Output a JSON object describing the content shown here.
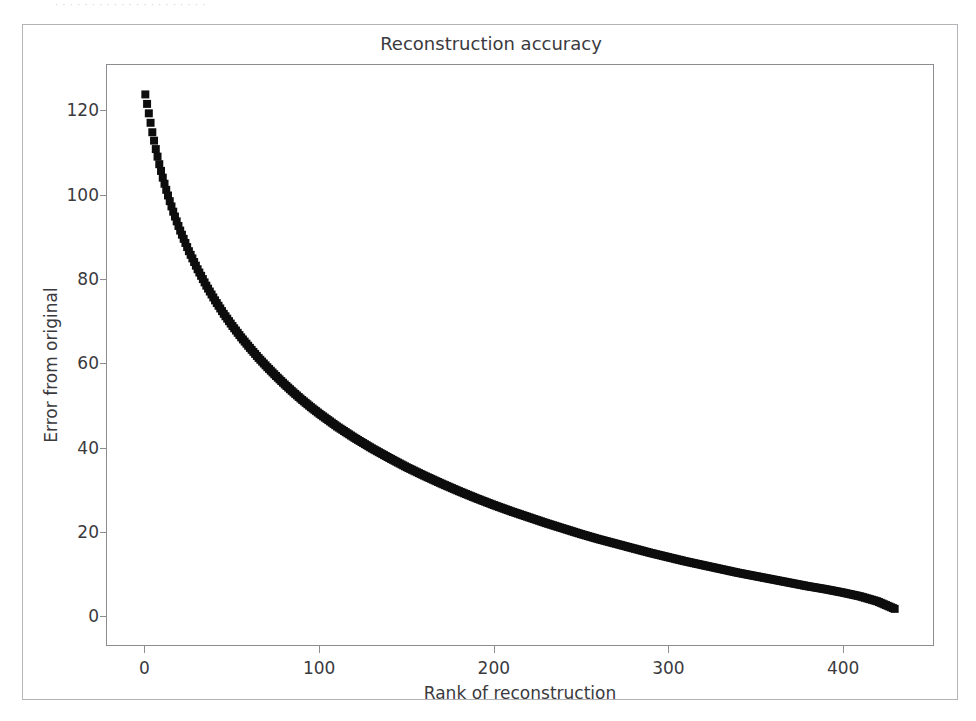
{
  "page": {
    "scan_sliver_text": "· · · ·  · · · · · · · ·            · · · ·  · ·  · · ·",
    "background_color": "#ffffff",
    "frame_color": "#b4b4b8"
  },
  "figure": {
    "title": "Reconstruction accuracy",
    "axes_color": "#8d8d91",
    "text_color": "#3a3a3e",
    "marker_color": "#0d0d0d"
  },
  "chart_data": {
    "type": "scatter",
    "title": "Reconstruction accuracy",
    "xlabel": "Rank of reconstruction",
    "ylabel": "Error from original",
    "xlim": [
      -22,
      452
    ],
    "ylim": [
      -7,
      131
    ],
    "xticks": [
      0,
      100,
      200,
      300,
      400
    ],
    "xtick_labels": [
      "0",
      "100",
      "200",
      "300",
      "400"
    ],
    "yticks": [
      0,
      20,
      40,
      60,
      80,
      100,
      120
    ],
    "ytick_labels": [
      "0",
      "20",
      "40",
      "60",
      "80",
      "100",
      "120"
    ],
    "grid": false,
    "legend": null,
    "marker": "square",
    "marker_size": 5,
    "series": [
      {
        "name": "reconstruction error",
        "x": [
          0,
          2,
          4,
          6,
          8,
          10,
          12,
          14,
          16,
          18,
          20,
          25,
          30,
          35,
          40,
          45,
          50,
          55,
          60,
          65,
          70,
          75,
          80,
          85,
          90,
          95,
          100,
          110,
          120,
          130,
          140,
          150,
          160,
          170,
          180,
          190,
          200,
          210,
          220,
          230,
          240,
          250,
          260,
          270,
          280,
          290,
          300,
          310,
          320,
          330,
          340,
          350,
          360,
          370,
          380,
          390,
          400,
          410,
          420,
          430
        ],
        "y": [
          124.0,
          119.5,
          115.0,
          111.0,
          107.4,
          104.2,
          101.3,
          98.6,
          96.1,
          93.8,
          91.6,
          86.7,
          82.4,
          78.5,
          75.0,
          71.8,
          68.9,
          66.2,
          63.7,
          61.3,
          59.1,
          57.0,
          55.0,
          53.1,
          51.3,
          49.6,
          48.0,
          45.0,
          42.3,
          39.8,
          37.5,
          35.3,
          33.3,
          31.4,
          29.6,
          27.9,
          26.3,
          24.8,
          23.4,
          22.0,
          20.7,
          19.4,
          18.2,
          17.1,
          16.0,
          14.9,
          13.9,
          12.9,
          12.0,
          11.1,
          10.2,
          9.4,
          8.6,
          7.8,
          7.0,
          6.3,
          5.5,
          4.6,
          3.4,
          1.6
        ]
      }
    ]
  }
}
